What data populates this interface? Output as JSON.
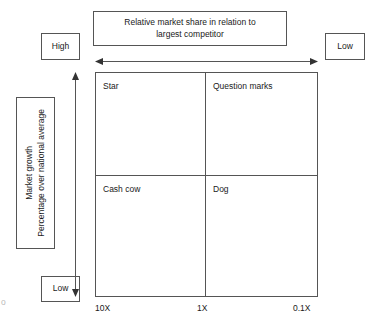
{
  "diagram": {
    "type": "bcg-growth-share-matrix",
    "header": {
      "line1": "Relative market share in relation to",
      "line2": "largest competitor"
    },
    "horizontal_axis": {
      "left_marker": "High",
      "right_marker": "Low",
      "arrow": "double-headed-horizontal-arrow",
      "ticks": [
        "10X",
        "1X",
        "0.1X"
      ]
    },
    "vertical_axis": {
      "label_line1": "Market growth",
      "label_line2": "Percentage over national average",
      "top_marker": "High",
      "bottom_marker": "Low",
      "arrow": "double-headed-vertical-arrow"
    },
    "quadrants": [
      {
        "name": "star",
        "label": "Star",
        "row": "top",
        "column": "left"
      },
      {
        "name": "question-marks",
        "label": "Question marks",
        "row": "top",
        "column": "right"
      },
      {
        "name": "cash-cow",
        "label": "Cash cow",
        "row": "bottom",
        "column": "left"
      },
      {
        "name": "dog",
        "label": "Dog",
        "row": "bottom",
        "column": "right"
      }
    ],
    "edge_artifact": "o",
    "colors": {
      "line": "#555555",
      "text": "#1a1a1a",
      "background": "#ffffff"
    }
  }
}
